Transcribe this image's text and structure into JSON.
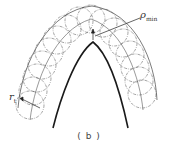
{
  "figure": {
    "caption": "( b )",
    "labels": {
      "rho_min": {
        "symbol": "ρ",
        "sub": "min"
      },
      "r_t": {
        "symbol": "r",
        "sub": "t"
      }
    },
    "colors": {
      "profile": "#1a1a1a",
      "circles": "#555555",
      "text": "#333333"
    }
  }
}
